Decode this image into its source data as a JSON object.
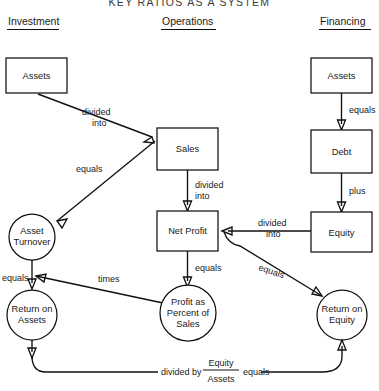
{
  "title": "KEY RATIOS AS A SYSTEM",
  "columns": [
    {
      "id": "investment",
      "label": "Investment"
    },
    {
      "id": "operations",
      "label": "Operations"
    },
    {
      "id": "financing",
      "label": "Financing"
    }
  ],
  "nodes": {
    "assets_left": {
      "label": "Assets",
      "shape": "rect"
    },
    "asset_turnover": {
      "line1": "Asset",
      "line2": "Turnover",
      "shape": "circle"
    },
    "return_on_assets": {
      "line1": "Return on",
      "line2": "Assets",
      "shape": "circle"
    },
    "sales": {
      "label": "Sales",
      "shape": "rect"
    },
    "net_profit": {
      "label": "Net Profit",
      "shape": "rect"
    },
    "profit_pct_sales": {
      "line1": "Profit as",
      "line2": "Percent of",
      "line3": "Sales",
      "shape": "circle"
    },
    "assets_right": {
      "label": "Assets",
      "shape": "rect"
    },
    "debt": {
      "label": "Debt",
      "shape": "rect"
    },
    "equity": {
      "label": "Equity",
      "shape": "rect"
    },
    "return_on_equity": {
      "line1": "Return on",
      "line2": "Equity",
      "shape": "circle"
    }
  },
  "edges": {
    "sales_div_into_assets": {
      "line1": "divided",
      "line2": "into"
    },
    "turnover_equals": {
      "label": "equals"
    },
    "sales_div_into_netprofit": {
      "line1": "divided",
      "line2": "into"
    },
    "netprofit_equals": {
      "label": "equals"
    },
    "roa_equals": {
      "label": "equals"
    },
    "roa_times": {
      "label": "times"
    },
    "assets_equals_debt": {
      "label": "equals"
    },
    "debt_plus_equity": {
      "label": "plus"
    },
    "equity_div_into": {
      "line1": "divided",
      "line2": "into"
    },
    "roe_equals": {
      "label": "equals"
    }
  },
  "bottom_equation": {
    "divided_by": "divided by",
    "numerator": "Equity",
    "denominator": "Assets",
    "equals": "equals"
  },
  "colors": {
    "stroke": "#111111",
    "text": "#1a1a1a",
    "background": "#ffffff"
  }
}
